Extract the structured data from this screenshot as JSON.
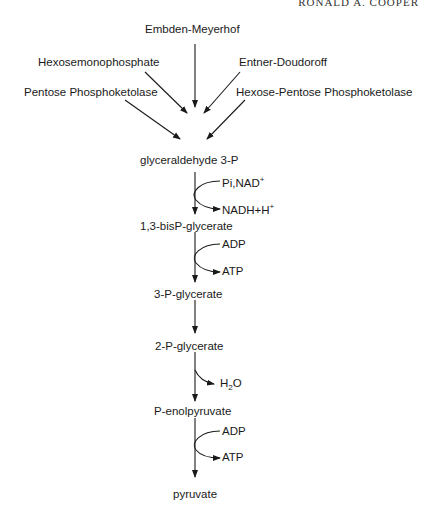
{
  "header": {
    "running_head": "RONALD A. COOPER"
  },
  "pathways": [
    {
      "label": "Embden-Meyerhof"
    },
    {
      "label": "Hexosemonophosphate"
    },
    {
      "label": "Entner-Doudoroff"
    },
    {
      "label": "Pentose Phosphoketolase"
    },
    {
      "label": "Hexose-Pentose Phosphoketolase"
    }
  ],
  "metabolites": [
    "glyceraldehyde 3-P",
    "1,3-bisP-glycerate",
    "3-P-glycerate",
    "2-P-glycerate",
    "P-enolpyruvate",
    "pyruvate"
  ],
  "cofactors": {
    "step1_in": "Pi,NAD",
    "step1_in_sup": "+",
    "step1_out": "NADH+H",
    "step1_out_sup": "+",
    "step2_in": "ADP",
    "step2_out": "ATP",
    "step4_out_main": "H",
    "step4_out_sub": "2",
    "step4_out_tail": "O",
    "step5_in": "ADP",
    "step5_out": "ATP"
  },
  "colors": {
    "ink": "#1a1a1a",
    "background": "#ffffff"
  }
}
